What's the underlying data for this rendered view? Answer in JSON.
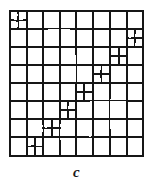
{
  "figure": {
    "caption": "c",
    "type": "adaptive-grid-mesh",
    "ink_color": "#161616",
    "background_color": "#ffffff",
    "base_grid": {
      "columns": 8,
      "rows": 8,
      "outer_border": true
    },
    "refined_cells_label": "cells subdivided into 2x2",
    "refined_cells": [
      {
        "col": 0,
        "row": 0
      },
      {
        "col": 7,
        "row": 1
      },
      {
        "col": 6,
        "row": 2
      },
      {
        "col": 5,
        "row": 3
      },
      {
        "col": 4,
        "row": 4
      },
      {
        "col": 3,
        "row": 5
      },
      {
        "col": 2,
        "row": 6
      },
      {
        "col": 1,
        "row": 7
      }
    ],
    "geometry": {
      "x0": 10,
      "y0": 11,
      "x1": 143,
      "y1": 156,
      "col_edges": [
        10,
        27,
        43,
        60,
        76,
        93,
        110,
        127,
        143
      ],
      "row_edges": [
        11,
        29,
        47,
        65,
        83,
        101,
        119,
        137,
        156
      ]
    }
  }
}
